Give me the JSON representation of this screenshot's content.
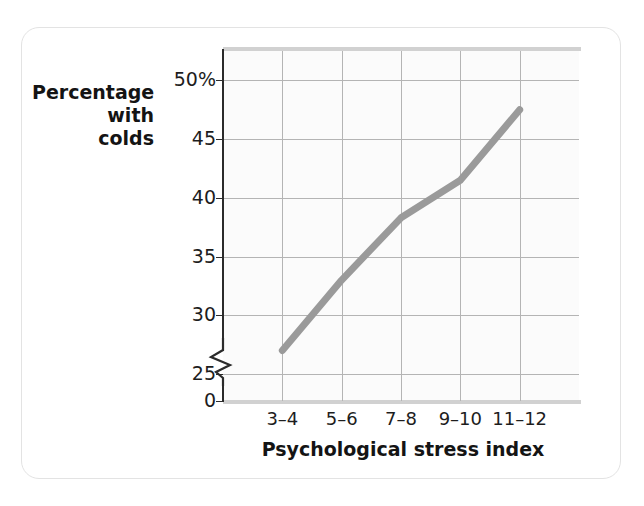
{
  "figure": {
    "background_color": "#ffffff",
    "card_border_color": "#e3e3e3",
    "plot_background_color": "#fbfbfb"
  },
  "chart_data": {
    "type": "line",
    "title": "",
    "subtitle": "",
    "xlabel": "Psychological stress index",
    "ylabel": "Percentage\nwith\ncolds",
    "ylabel_lines": [
      "Percentage",
      "with",
      "colds"
    ],
    "categories": [
      "3–4",
      "5–6",
      "7–8",
      "9–10",
      "11–12"
    ],
    "values": [
      27,
      33,
      38.3,
      41.5,
      47.5
    ],
    "series": [
      {
        "name": "Percentage with colds",
        "values": [
          27,
          33,
          38.3,
          41.5,
          47.5
        ],
        "color": "#9a9a9a",
        "line_width": 7
      }
    ],
    "ytick_labels": [
      "50%",
      "45",
      "40",
      "35",
      "30",
      "25",
      "0"
    ],
    "ytick_values": [
      50,
      45,
      40,
      35,
      30,
      25,
      0
    ],
    "ylim": [
      25,
      52.5
    ],
    "y_axis_break": true,
    "y_axis_break_between": [
      0,
      25
    ],
    "grid": true,
    "grid_color": "#b4b4b4",
    "legend": false,
    "legend_position": "none",
    "annotations": []
  },
  "axes": {
    "y_caption_lines": [
      "Percentage",
      "with",
      "colds"
    ],
    "x_title": "Psychological stress index",
    "y_ticks": [
      {
        "label": "50%",
        "value": 50
      },
      {
        "label": "45",
        "value": 45
      },
      {
        "label": "40",
        "value": 40
      },
      {
        "label": "35",
        "value": 35
      },
      {
        "label": "30",
        "value": 30
      },
      {
        "label": "25",
        "value": 25
      },
      {
        "label": "0",
        "value": 0
      }
    ],
    "x_ticks": [
      {
        "label": "3–4"
      },
      {
        "label": "5–6"
      },
      {
        "label": "7–8"
      },
      {
        "label": "9–10"
      },
      {
        "label": "11–12"
      }
    ]
  }
}
